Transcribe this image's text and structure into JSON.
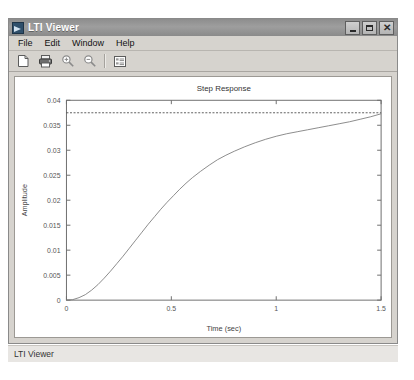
{
  "window": {
    "title": "LTI Viewer",
    "icon": "matlab-lti-icon",
    "controls": [
      {
        "name": "minimize",
        "label": "Minimize"
      },
      {
        "name": "maximize",
        "label": "Maximize"
      },
      {
        "name": "close",
        "label": "Close"
      }
    ]
  },
  "menu": {
    "items": [
      {
        "label": "File"
      },
      {
        "label": "Edit"
      },
      {
        "label": "Window"
      },
      {
        "label": "Help"
      }
    ]
  },
  "toolbar": {
    "buttons": [
      {
        "name": "new-document-icon",
        "tooltip": "New"
      },
      {
        "name": "print-icon",
        "tooltip": "Print"
      },
      {
        "name": "zoom-in-icon",
        "tooltip": "Zoom In"
      },
      {
        "name": "zoom-out-icon",
        "tooltip": "Zoom Out"
      },
      {
        "name": "properties-list-icon",
        "tooltip": "Properties"
      }
    ]
  },
  "statusbar": {
    "text": "LTI Viewer"
  },
  "colors": {
    "title_bar": "#8d8d8d",
    "window_face": "#d6d3ce",
    "plot_background": "#ffffff",
    "curve": "#7d7d7d",
    "steady_state_line": "#4a4a4a",
    "axis": "#6e6e6e"
  },
  "chart_data": {
    "type": "line",
    "title": "Step Response",
    "xlabel": "Time (sec)",
    "ylabel": "Amplitude",
    "xlim": [
      0,
      1.5
    ],
    "ylim": [
      0,
      0.04
    ],
    "xticks": [
      0,
      0.5,
      1,
      1.5
    ],
    "xticklabels": [
      "0",
      "0.5",
      "1",
      "1.5"
    ],
    "yticks": [
      0,
      0.005,
      0.01,
      0.015,
      0.02,
      0.025,
      0.03,
      0.035,
      0.04
    ],
    "yticklabels": [
      "0",
      "0.005",
      "0.01",
      "0.015",
      "0.02",
      "0.025",
      "0.03",
      "0.035",
      "0.04"
    ],
    "grid": false,
    "legend": null,
    "series": [
      {
        "name": "Step Response",
        "style": "solid",
        "color": "#7d7d7d",
        "x": [
          0,
          0.03,
          0.06,
          0.09,
          0.12,
          0.15,
          0.18,
          0.21,
          0.24,
          0.27,
          0.3,
          0.33,
          0.36,
          0.39,
          0.42,
          0.45,
          0.48,
          0.51,
          0.54,
          0.57,
          0.6,
          0.64,
          0.68,
          0.72,
          0.76,
          0.8,
          0.85,
          0.9,
          0.95,
          1.0,
          1.05,
          1.1,
          1.15,
          1.2,
          1.25,
          1.3,
          1.35,
          1.4,
          1.45,
          1.5
        ],
        "y": [
          0.0,
          0.0001,
          0.0005,
          0.0011,
          0.002,
          0.0031,
          0.0044,
          0.0058,
          0.0073,
          0.0088,
          0.0104,
          0.012,
          0.0136,
          0.0152,
          0.0167,
          0.0182,
          0.0196,
          0.0209,
          0.0222,
          0.0234,
          0.0245,
          0.0258,
          0.027,
          0.0281,
          0.029,
          0.0298,
          0.0307,
          0.0315,
          0.0322,
          0.0328,
          0.0333,
          0.0337,
          0.0341,
          0.0345,
          0.0349,
          0.0353,
          0.0357,
          0.0362,
          0.0367,
          0.0373
        ]
      },
      {
        "name": "Steady State",
        "style": "dotted",
        "color": "#4a4a4a",
        "x": [
          0,
          1.5
        ],
        "y": [
          0.0375,
          0.0375
        ]
      }
    ]
  }
}
